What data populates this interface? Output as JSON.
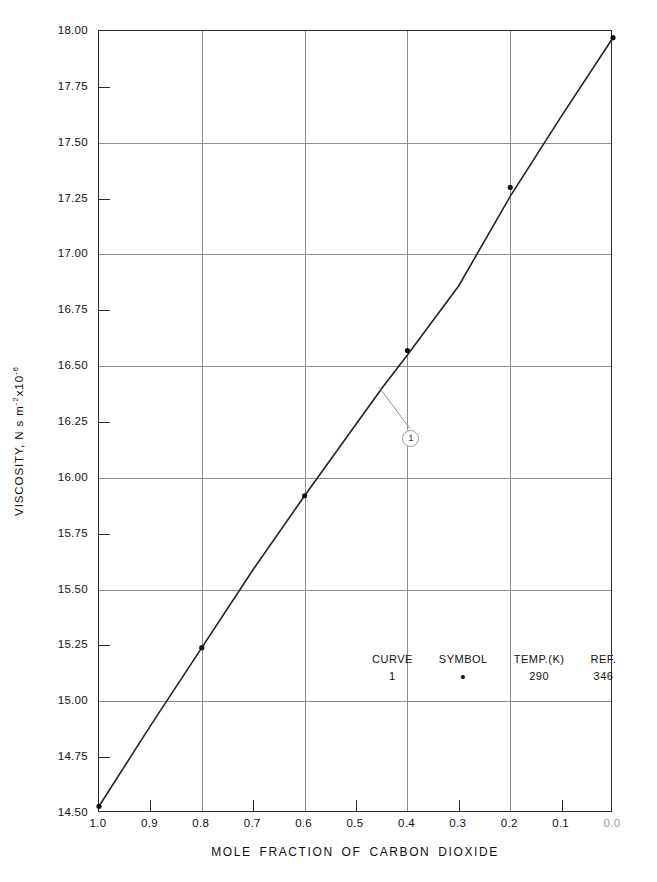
{
  "chart_data": {
    "type": "line",
    "title": "",
    "xlabel": "MOLE FRACTION OF CARBON DIOXIDE",
    "ylabel": "VISCOSITY, N s m⁻² x10⁻⁶",
    "ylabel_parts": {
      "prefix": "VISCOSITY, N s m",
      "exp1": "-2",
      "mid": "x10",
      "exp2": "-6"
    },
    "xlim": [
      1.0,
      0.0
    ],
    "ylim": [
      14.5,
      18.0
    ],
    "x_reversed": true,
    "grid": "major",
    "legend_position": "inside-center",
    "x_ticks": [
      1.0,
      0.9,
      0.8,
      0.7,
      0.6,
      0.5,
      0.4,
      0.3,
      0.2,
      0.1,
      0.0
    ],
    "x_tick_labels": [
      "1.0",
      "0.9",
      "0.8",
      "0.7",
      "0.6",
      "0.5",
      "0.4",
      "0.3",
      "0.2",
      "0.1",
      "0.0"
    ],
    "x_major_gridlines": [
      0.8,
      0.6,
      0.4,
      0.2
    ],
    "y_ticks": [
      14.5,
      14.75,
      15.0,
      15.25,
      15.5,
      15.75,
      16.0,
      16.25,
      16.5,
      16.75,
      17.0,
      17.25,
      17.5,
      17.75,
      18.0
    ],
    "y_tick_labels": [
      "14.50",
      "14.75",
      "15.00",
      "15.25",
      "15.50",
      "15.75",
      "16.00",
      "16.25",
      "16.50",
      "16.75",
      "17.00",
      "17.25",
      "17.50",
      "17.75",
      "18.00"
    ],
    "y_major_gridlines": [
      15.0,
      15.5,
      16.0,
      16.5,
      17.0,
      17.5
    ],
    "series": [
      {
        "name": "1",
        "curve_label": "1",
        "symbol": "•",
        "temperature_K": "290",
        "reference": "346",
        "line_x": [
          1.0,
          0.9,
          0.8,
          0.7,
          0.6,
          0.5,
          0.45,
          0.4,
          0.3,
          0.2,
          0.1,
          0.0
        ],
        "line_y": [
          14.53,
          14.89,
          15.24,
          15.59,
          15.92,
          16.24,
          16.4,
          16.55,
          16.86,
          17.26,
          17.62,
          17.97
        ],
        "points_x": [
          1.0,
          0.8,
          0.6,
          0.4,
          0.2,
          0.0
        ],
        "points_y": [
          14.53,
          15.24,
          15.92,
          16.57,
          17.3,
          17.97
        ]
      }
    ],
    "callout": {
      "label": "1",
      "x": 0.395,
      "y": 16.18,
      "leader_to_x": 0.455,
      "leader_to_y": 16.405
    }
  },
  "legend": {
    "headers": [
      "CURVE",
      "SYMBOL",
      "TEMP.(K)",
      "REF."
    ],
    "rows": [
      {
        "curve": "1",
        "symbol": "•",
        "temp": "290",
        "ref": "346"
      }
    ]
  }
}
